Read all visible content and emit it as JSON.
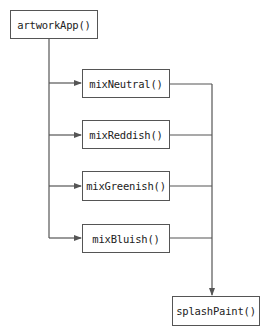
{
  "diagram": {
    "type": "call-flow",
    "colors": {
      "line": "#555555",
      "text": "#222222",
      "background": "#ffffff"
    },
    "root": {
      "label": "artworkApp()"
    },
    "children": [
      {
        "label": "mixNeutral()"
      },
      {
        "label": "mixReddish()"
      },
      {
        "label": "mixGreenish()"
      },
      {
        "label": "mixBluish()"
      }
    ],
    "sink": {
      "label": "splashPaint()"
    }
  }
}
